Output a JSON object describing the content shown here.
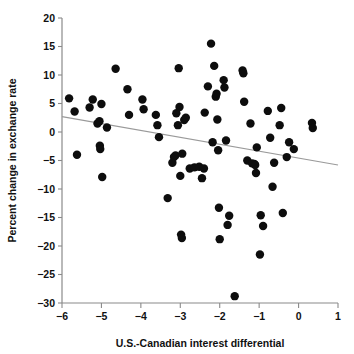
{
  "chart_data": {
    "type": "scatter",
    "title": "",
    "xlabel": "U.S.-Canadian interest differential",
    "ylabel": "Percent change in exchange rate",
    "xlim": [
      -6,
      1
    ],
    "ylim": [
      -30,
      20
    ],
    "xticks": [
      -6,
      -5,
      -4,
      -3,
      -2,
      -1,
      0,
      1
    ],
    "xtick_labels": [
      "−6",
      "−5",
      "−4",
      "−3",
      "−2",
      "−1",
      "0",
      "1"
    ],
    "yticks": [
      -30,
      -25,
      -20,
      -15,
      -10,
      -5,
      0,
      5,
      10,
      15,
      20
    ],
    "ytick_labels": [
      "−30",
      "−25",
      "−20",
      "−15",
      "−10",
      "−5",
      "0",
      "5",
      "10",
      "15",
      "20"
    ],
    "grid": false,
    "legend": null,
    "marker": "filled-circle",
    "marker_color": "#0d0d0d",
    "marker_size": 4.2,
    "trendline": {
      "visible": true,
      "color": "#9a9a9a",
      "x_start": -6,
      "y_start": 2.7,
      "x_end": 1,
      "y_end": -5.8
    },
    "n_points": 93,
    "points": [
      [
        -5.82,
        5.9
      ],
      [
        -5.68,
        3.6
      ],
      [
        -5.62,
        -4.0
      ],
      [
        -5.3,
        4.3
      ],
      [
        -5.22,
        5.7
      ],
      [
        -5.1,
        1.5
      ],
      [
        -5.05,
        1.9
      ],
      [
        -5.04,
        -2.4
      ],
      [
        -5.03,
        -3.0
      ],
      [
        -5.0,
        4.9
      ],
      [
        -4.98,
        -7.9
      ],
      [
        -4.86,
        0.8
      ],
      [
        -4.64,
        11.1
      ],
      [
        -4.34,
        7.5
      ],
      [
        -4.3,
        3.0
      ],
      [
        -3.96,
        5.7
      ],
      [
        -3.93,
        4.0
      ],
      [
        -3.62,
        3.0
      ],
      [
        -3.58,
        1.2
      ],
      [
        -3.54,
        -0.9
      ],
      [
        -3.32,
        -11.6
      ],
      [
        -3.2,
        -5.4
      ],
      [
        -3.16,
        -4.4
      ],
      [
        -3.12,
        -4.1
      ],
      [
        -3.1,
        3.3
      ],
      [
        -3.06,
        1.2
      ],
      [
        -3.04,
        11.2
      ],
      [
        -3.02,
        4.4
      ],
      [
        -3.0,
        -7.7
      ],
      [
        -2.98,
        -18.0
      ],
      [
        -2.96,
        -18.6
      ],
      [
        -2.95,
        -3.8
      ],
      [
        -2.9,
        2.1
      ],
      [
        -2.86,
        2.5
      ],
      [
        -2.76,
        -6.4
      ],
      [
        -2.64,
        -6.2
      ],
      [
        -2.52,
        -6.1
      ],
      [
        -2.45,
        -8.1
      ],
      [
        -2.4,
        -6.4
      ],
      [
        -2.38,
        3.4
      ],
      [
        -2.3,
        8.0
      ],
      [
        -2.22,
        15.5
      ],
      [
        -2.18,
        -1.8
      ],
      [
        -2.14,
        11.6
      ],
      [
        -2.1,
        6.2
      ],
      [
        -2.08,
        6.7
      ],
      [
        -2.06,
        2.2
      ],
      [
        -2.04,
        -3.2
      ],
      [
        -2.02,
        -13.3
      ],
      [
        -2.0,
        -18.8
      ],
      [
        -1.9,
        9.1
      ],
      [
        -1.88,
        7.8
      ],
      [
        -1.84,
        -1.5
      ],
      [
        -1.8,
        -16.3
      ],
      [
        -1.76,
        -14.7
      ],
      [
        -1.62,
        -28.8
      ],
      [
        -1.42,
        10.8
      ],
      [
        -1.4,
        10.3
      ],
      [
        -1.38,
        5.3
      ],
      [
        -1.3,
        -5.0
      ],
      [
        -1.22,
        1.5
      ],
      [
        -1.18,
        -5.5
      ],
      [
        -1.12,
        -5.6
      ],
      [
        -1.1,
        -5.8
      ],
      [
        -1.08,
        -7.2
      ],
      [
        -1.06,
        -2.7
      ],
      [
        -0.98,
        -21.5
      ],
      [
        -0.96,
        -14.6
      ],
      [
        -0.9,
        -16.5
      ],
      [
        -0.78,
        3.7
      ],
      [
        -0.72,
        -1.0
      ],
      [
        -0.66,
        -9.6
      ],
      [
        -0.62,
        -5.4
      ],
      [
        -0.48,
        1.2
      ],
      [
        -0.44,
        4.2
      ],
      [
        -0.4,
        -14.2
      ],
      [
        -0.3,
        -4.4
      ],
      [
        -0.24,
        -1.8
      ],
      [
        -0.12,
        -3.0
      ],
      [
        0.34,
        1.6
      ],
      [
        0.36,
        0.7
      ]
    ]
  },
  "axes": {
    "x_axis_name": "x-axis",
    "y_axis_name": "y-axis"
  }
}
